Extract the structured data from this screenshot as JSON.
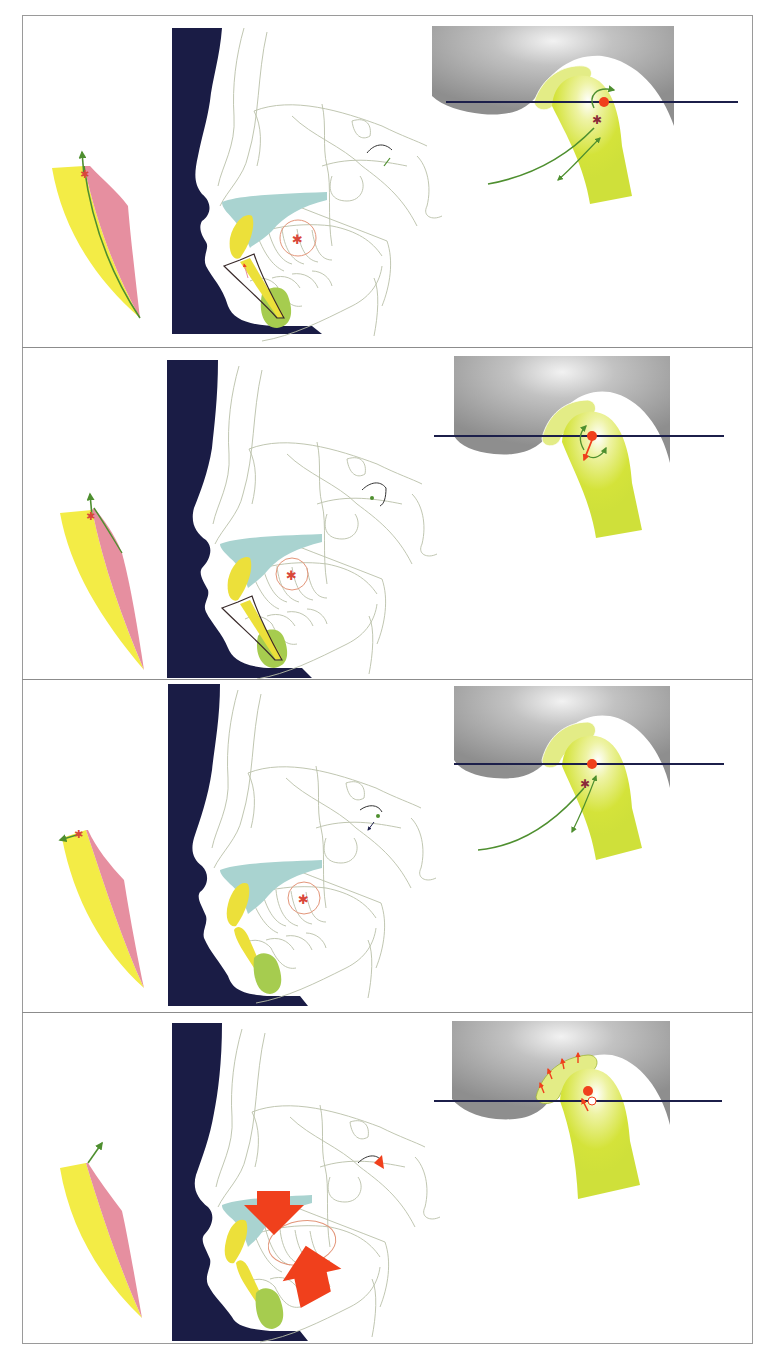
{
  "figure": {
    "type": "sequential anatomical diagram",
    "panel_count": 4,
    "layout": "four stacked panels, each: tooth wedge (left), cephalometric facial profile (center), TMJ condyle in fossa (right)",
    "colors": {
      "frame": "#9a9a9a",
      "soft_tissue_profile": "#1a1c45",
      "tracing_line": "#b9bfa8",
      "maxilla": "#a9d3d0",
      "incisor": "#ece03a",
      "symphysis": "#a6cc4f",
      "wedge_yellow": "#f3ec46",
      "wedge_pink": "#e68fa0",
      "arrow_green": "#4e8f2f",
      "center_marker": "#d9473a",
      "fossa_gray": "#9d9d9d",
      "fossa_highlight": "#e6e6e6",
      "condyle": "#d4e33a",
      "disc": "#e3ec86",
      "reference_line": "#1c1f4a",
      "force_red": "#f0401c",
      "rotation_circle": "#e3967a"
    }
  },
  "panels": [
    {
      "id": "panel-1",
      "wedge_arrow": "up",
      "wedge_line": true,
      "incisor_outline": true,
      "condyle_path": "forward-down arc with rotation arrow",
      "big_arrows": false
    },
    {
      "id": "panel-2",
      "wedge_arrow": "up",
      "wedge_line": false,
      "incisor_outline": true,
      "condyle_path": "local rotation arrows with red vector",
      "big_arrows": false
    },
    {
      "id": "panel-3",
      "wedge_arrow": "left",
      "wedge_line": false,
      "incisor_outline": false,
      "condyle_path": "forward-down arc",
      "big_arrows": false
    },
    {
      "id": "panel-4",
      "wedge_arrow": "up-right",
      "wedge_line": false,
      "incisor_outline": false,
      "condyle_path": "disc force arrows, open circle shift",
      "big_arrows": true
    }
  ]
}
